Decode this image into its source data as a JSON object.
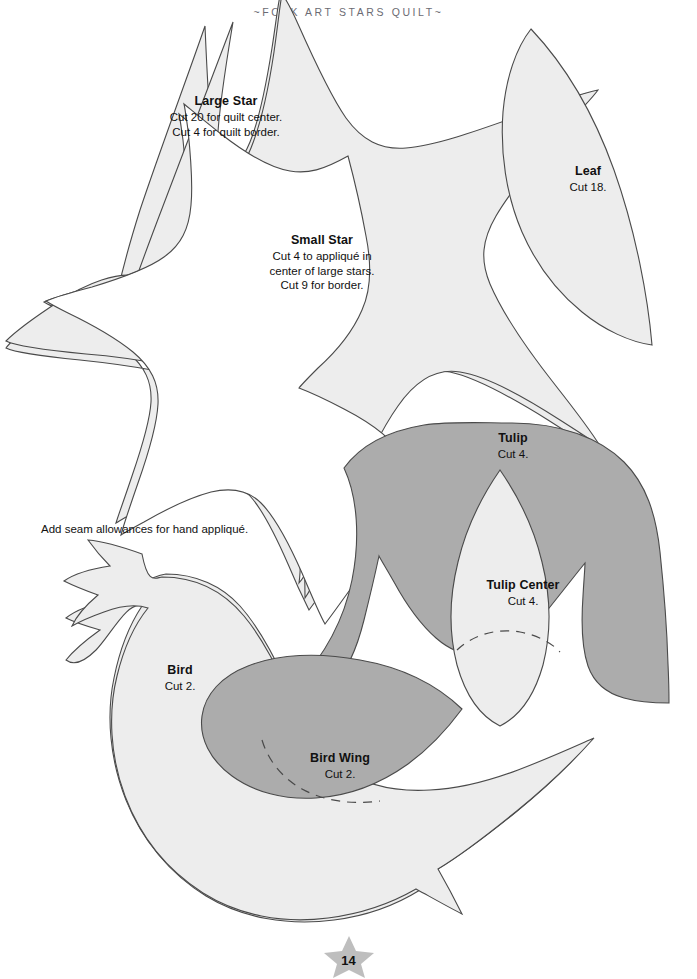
{
  "page": {
    "running_head": "~FOLK ART STARS QUILT~",
    "folio": "14",
    "footer_ornament": "star-icon"
  },
  "notes": {
    "seam_allowance": "Add seam allowances for hand appliqué."
  },
  "templates": [
    {
      "id": "large-star",
      "title": "Large Star",
      "lines": [
        "Cut 20 for quilt center.",
        "Cut 4 for quilt border."
      ],
      "fill": "#EDEDED",
      "stroke": "#4a4a4a"
    },
    {
      "id": "small-star",
      "title": "Small Star",
      "lines": [
        "Cut 4 to appliqué in",
        "center of large stars.",
        "Cut 9 for border."
      ],
      "fill": "#FFFFFF",
      "stroke": "#4a4a4a"
    },
    {
      "id": "leaf",
      "title": "Leaf",
      "lines": [
        "Cut 18."
      ],
      "fill": "#EDEDED",
      "stroke": "#4a4a4a"
    },
    {
      "id": "tulip",
      "title": "Tulip",
      "lines": [
        "Cut 4."
      ],
      "fill": "#ACACAC",
      "stroke": "#4a4a4a"
    },
    {
      "id": "tulip-center",
      "title": "Tulip Center",
      "lines": [
        "Cut 4."
      ],
      "fill": "#EDEDED",
      "stroke": "#4a4a4a"
    },
    {
      "id": "bird",
      "title": "Bird",
      "lines": [
        "Cut 2."
      ],
      "fill": "#EDEDED",
      "stroke": "#4a4a4a"
    },
    {
      "id": "bird-wing",
      "title": "Bird Wing",
      "lines": [
        "Cut 2."
      ],
      "fill": "#ACACAC",
      "stroke": "#4a4a4a"
    }
  ],
  "colors": {
    "paper": "#FFFFFF",
    "light_fill": "#EDEDED",
    "gray_fill": "#ACACAC",
    "outline": "#4a4a4a",
    "header_text": "#6b6b73",
    "body_text": "#111111",
    "footer_star": "#BEBEBE"
  }
}
